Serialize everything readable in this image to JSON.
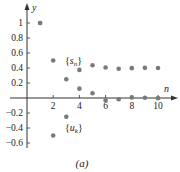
{
  "chart_data": {
    "type": "scatter",
    "title": "",
    "caption": "(a)",
    "xlabel": "n",
    "ylabel": "y",
    "xlim": [
      0,
      11.5
    ],
    "ylim": [
      -0.7,
      1.15
    ],
    "x_ticks": [
      2,
      4,
      6,
      8,
      10
    ],
    "x_tick_labels": [
      "2",
      "4",
      "6",
      "8",
      "10"
    ],
    "y_ticks": [
      1,
      0.8,
      0.6,
      0.4,
      0.2,
      -0.2,
      -0.4,
      -0.6
    ],
    "y_tick_labels": [
      "1",
      "0.8",
      "0.6",
      "0.4",
      "0.2",
      "−0.2",
      "−0.4",
      "−0.6"
    ],
    "grid": false,
    "legend": "inline annotations",
    "series": [
      {
        "name": "{s_n}",
        "label_main": "s",
        "label_sub": "n",
        "x": [
          1,
          2,
          3,
          4,
          5,
          6,
          7,
          8,
          9,
          10
        ],
        "values": [
          1,
          0.5,
          0.25,
          0.375,
          0.4375,
          0.406,
          0.391,
          0.398,
          0.402,
          0.4
        ]
      },
      {
        "name": "{u_k}",
        "label_main": "u",
        "label_sub": "k",
        "x": [
          1,
          2,
          3,
          4,
          5,
          6,
          7,
          8,
          9,
          10
        ],
        "values": [
          1,
          -0.5,
          -0.25,
          0.125,
          0.0625,
          -0.031,
          -0.016,
          0.008,
          0.004,
          -0.002
        ]
      }
    ],
    "point_color": "#7a7a7a",
    "axis_color": "#333333"
  }
}
